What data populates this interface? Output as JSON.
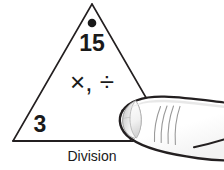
{
  "diagram": {
    "kind": "fact-family-triangle",
    "caption": "Division",
    "apex": {
      "marker": "filled-dot",
      "value": "15"
    },
    "operations": "×, ÷",
    "bottom_left": {
      "value": "3"
    },
    "bottom_right": {
      "value": "",
      "state": "covered-by-finger"
    },
    "colors": {
      "ink": "#1a1a1a",
      "outline": "#231f20",
      "background": "#ffffff",
      "nail_light": "#fafafa",
      "nail_mid": "#d8d8d8",
      "nail_shadow": "#b4b4b4",
      "skin_shade": "#efefef",
      "crease": "#9a9a9a"
    }
  },
  "hand": {
    "label": "pointing-finger",
    "direction": "left",
    "parts": {
      "fingernail": "fingernail",
      "creases": "knuckle-crease-lines",
      "finger_outline": "finger-outline"
    }
  }
}
